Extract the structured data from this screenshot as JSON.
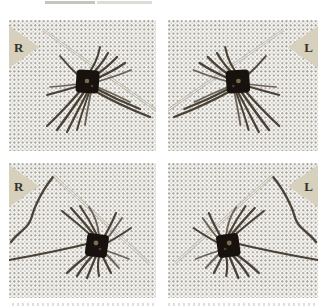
{
  "figure": {
    "type": "photo-grid",
    "rows": 2,
    "cols": 2
  },
  "panels": [
    {
      "label": "R",
      "marker_corner": "top-left",
      "row": "top"
    },
    {
      "label": "L",
      "marker_corner": "top-right",
      "row": "top"
    },
    {
      "label": "R",
      "marker_corner": "top-left",
      "row": "bottom"
    },
    {
      "label": "L",
      "marker_corner": "top-right",
      "row": "bottom"
    }
  ],
  "colors": {
    "page_bg": "#ffffff",
    "board_bg": "#f7f6f2",
    "board_dot": "#8e8c83",
    "marker_fill": "#d6d0bc",
    "marker_letter": "#35322b",
    "whisker": "#4a4136",
    "follicle_pad": "#17120d",
    "pin": "#b3b0a4"
  }
}
